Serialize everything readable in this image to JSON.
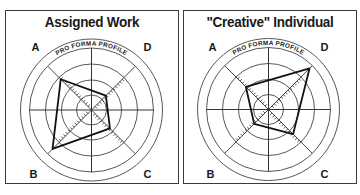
{
  "panels": [
    {
      "title": "Assigned Work",
      "arc_label": "PRO FORMA PROFILE",
      "quadrant_labels": {
        "A": "A",
        "B": "B",
        "C": "C",
        "D": "D"
      }
    },
    {
      "title": "\"Creative\" Individual",
      "arc_label": "PRO FORMA PROFILE",
      "quadrant_labels": {
        "A": "A",
        "B": "B",
        "C": "C",
        "D": "D"
      }
    }
  ],
  "chart_data": [
    {
      "type": "radar",
      "title": "Assigned Work",
      "subtitle": "PRO FORMA PROFILE",
      "axes": [
        "A",
        "D",
        "C",
        "B"
      ],
      "axis_directions": {
        "A": "upper-left",
        "D": "upper-right",
        "C": "lower-right",
        "B": "lower-left"
      },
      "values": {
        "A": 0.75,
        "D": 0.35,
        "C": 0.45,
        "B": 0.95
      },
      "rings": 4,
      "range": [
        0,
        1
      ]
    },
    {
      "type": "radar",
      "title": "\"Creative\" Individual",
      "subtitle": "PRO FORMA PROFILE",
      "axes": [
        "A",
        "D",
        "C",
        "B"
      ],
      "axis_directions": {
        "A": "upper-left",
        "D": "upper-right",
        "C": "lower-right",
        "B": "lower-left"
      },
      "values": {
        "A": 0.55,
        "D": 1.0,
        "C": 0.6,
        "B": 0.35
      },
      "rings": 4,
      "range": [
        0,
        1
      ]
    }
  ]
}
